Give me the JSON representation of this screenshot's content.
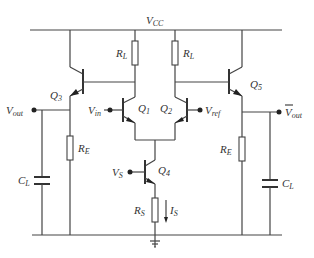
{
  "diagram": {
    "labels": {
      "vcc": "V",
      "vcc_sub": "CC",
      "rl_left": "R",
      "rl_left_sub": "L",
      "rl_right": "R",
      "rl_right_sub": "L",
      "q3": "Q",
      "q3_sub": "3",
      "q1": "Q",
      "q1_sub": "1",
      "q2": "Q",
      "q2_sub": "2",
      "q5": "Q",
      "q5_sub": "5",
      "q4": "Q",
      "q4_sub": "4",
      "vin": "V",
      "vin_sub": "in",
      "vref": "V",
      "vref_sub": "ref",
      "vout": "V",
      "vout_sub": "out",
      "vout_bar": "V",
      "vout_bar_sub": "out",
      "vs": "V",
      "vs_sub": "S",
      "re_left": "R",
      "re_left_sub": "E",
      "re_right": "R",
      "re_right_sub": "E",
      "cl_left": "C",
      "cl_left_sub": "L",
      "cl_right": "C",
      "cl_right_sub": "L",
      "rs": "R",
      "rs_sub": "S",
      "is": "I",
      "is_sub": "S"
    },
    "components": [
      {
        "id": "Q1",
        "type": "npn-transistor"
      },
      {
        "id": "Q2",
        "type": "npn-transistor"
      },
      {
        "id": "Q3",
        "type": "npn-transistor"
      },
      {
        "id": "Q4",
        "type": "npn-transistor"
      },
      {
        "id": "Q5",
        "type": "npn-transistor"
      },
      {
        "id": "RL1",
        "type": "resistor"
      },
      {
        "id": "RL2",
        "type": "resistor"
      },
      {
        "id": "RE1",
        "type": "resistor"
      },
      {
        "id": "RE2",
        "type": "resistor"
      },
      {
        "id": "RS",
        "type": "resistor"
      },
      {
        "id": "CL1",
        "type": "capacitor"
      },
      {
        "id": "CL2",
        "type": "capacitor"
      }
    ]
  }
}
